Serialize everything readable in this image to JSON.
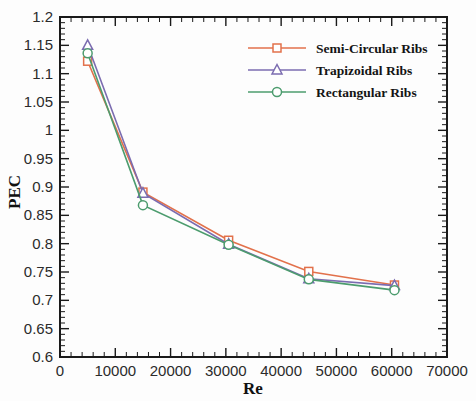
{
  "chart_data": {
    "type": "line",
    "title": "",
    "xlabel": "Re",
    "ylabel": "PEC",
    "xlim": [
      0,
      70000
    ],
    "ylim": [
      0.6,
      1.2
    ],
    "xticks": [
      0,
      10000,
      20000,
      30000,
      40000,
      50000,
      60000,
      70000
    ],
    "xtick_labels": [
      "0",
      "10000",
      "20000",
      "30000",
      "40000",
      "50000",
      "60000",
      "70000"
    ],
    "yticks": [
      0.6,
      0.65,
      0.7,
      0.75,
      0.8,
      0.85,
      0.9,
      0.95,
      1.0,
      1.05,
      1.1,
      1.15,
      1.2
    ],
    "ytick_labels": [
      "0.6",
      "0.65",
      "0.7",
      "0.75",
      "0.8",
      "0.85",
      "0.9",
      "0.95",
      "1",
      "1.05",
      "1.1",
      "1.15",
      "1.2"
    ],
    "x": [
      5000,
      15000,
      30500,
      45000,
      60500
    ],
    "grid": false,
    "legend_position": "top-right",
    "series": [
      {
        "name": "Semi-Circular Ribs",
        "color": "#e2714b",
        "marker": "square",
        "values": [
          1.122,
          0.891,
          0.806,
          0.751,
          0.727
        ]
      },
      {
        "name": "Trapizoidal Ribs",
        "color": "#7b6cb0",
        "marker": "triangle",
        "values": [
          1.15,
          0.889,
          0.799,
          0.738,
          0.726
        ]
      },
      {
        "name": "Rectangular Ribs",
        "color": "#4c9c6e",
        "marker": "circle",
        "values": [
          1.136,
          0.868,
          0.798,
          0.737,
          0.718
        ]
      }
    ]
  },
  "legend": {
    "items": [
      {
        "label": "Semi-Circular Ribs"
      },
      {
        "label": "Trapizoidal Ribs"
      },
      {
        "label": "Rectangular Ribs"
      }
    ]
  },
  "axes": {
    "x_title": "Re",
    "y_title": "PEC"
  }
}
